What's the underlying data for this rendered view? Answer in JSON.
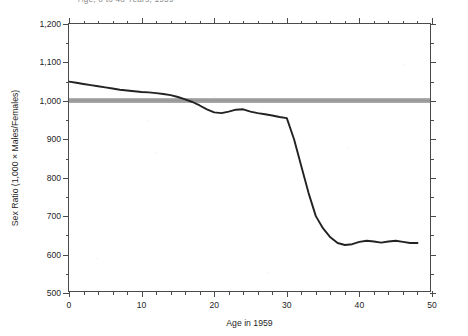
{
  "chart_data": {
    "type": "line",
    "title": "Age, 0 to 48 Years, 1959",
    "xlabel": "Age in 1959",
    "ylabel": "Sex Ratio (1,000 × Males/Females)",
    "xlim": [
      0,
      50
    ],
    "ylim": [
      500,
      1200
    ],
    "x_major_ticks": [
      0,
      10,
      20,
      30,
      40,
      50
    ],
    "x_tick_labels": [
      "0",
      "10",
      "20",
      "30",
      "40",
      "50"
    ],
    "x_minor_step": 2,
    "y_major_ticks": [
      500,
      600,
      700,
      800,
      900,
      1000,
      1100,
      1200
    ],
    "y_tick_labels": [
      "500",
      "600",
      "700",
      "800",
      "900",
      "1,000",
      "1,100",
      "1,200"
    ],
    "y_minor_step": 50,
    "grid": false,
    "legend": "none",
    "reference_line": {
      "name": "parity-band",
      "value": 1000,
      "label": "1,000 (equal numbers of males and females)",
      "color": "#9a9a9a",
      "style": "thick shaded horizontal band"
    },
    "series": [
      {
        "name": "Sex ratio",
        "color": "#222222",
        "x": [
          0,
          1,
          2,
          3,
          4,
          5,
          6,
          7,
          8,
          9,
          10,
          11,
          12,
          13,
          14,
          15,
          16,
          17,
          18,
          19,
          20,
          21,
          22,
          23,
          24,
          25,
          26,
          27,
          28,
          29,
          30,
          31,
          32,
          33,
          34,
          35,
          36,
          37,
          38,
          39,
          40,
          41,
          42,
          43,
          44,
          45,
          46,
          47,
          48
        ],
        "values": [
          1050,
          1047,
          1044,
          1041,
          1038,
          1035,
          1032,
          1029,
          1027,
          1025,
          1023,
          1022,
          1020,
          1018,
          1015,
          1010,
          1004,
          997,
          988,
          978,
          970,
          968,
          972,
          977,
          978,
          972,
          968,
          965,
          962,
          958,
          955,
          900,
          830,
          760,
          700,
          668,
          645,
          630,
          625,
          627,
          633,
          636,
          634,
          631,
          634,
          636,
          633,
          630,
          630
        ]
      }
    ],
    "annotations": [
      {
        "name": "peak-at-birth",
        "x": 0,
        "y": 1050,
        "text": "Highest ratio at age 0"
      },
      {
        "name": "crossing-parity",
        "x": 18,
        "y": 1000,
        "text": "Curve crosses the 1,000 parity band near age 18"
      },
      {
        "name": "war-deficit-drop",
        "x": 31,
        "y": 955,
        "text": "Sharp decline begins just after age 30"
      },
      {
        "name": "plateau",
        "x": 40,
        "y": 632,
        "text": "Ratio levels off near 630 for ages 37-48"
      }
    ]
  }
}
